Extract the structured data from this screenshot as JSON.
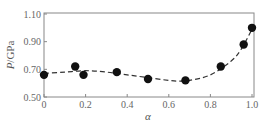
{
  "chart_data": {
    "type": "scatter",
    "title": "",
    "xlabel": "α",
    "ylabel": "P/GPa",
    "ylabel_italic_part": "P",
    "ylabel_rest": "/GPa",
    "xlim": [
      0,
      1.0
    ],
    "ylim": [
      0.5,
      1.1
    ],
    "xticks": [
      0,
      0.2,
      0.4,
      0.6,
      0.8,
      1.0
    ],
    "xtick_labels": [
      "0",
      "0.2",
      "0.4",
      "0.6",
      "0.8",
      "1.0"
    ],
    "yticks": [
      0.5,
      0.7,
      0.9,
      1.1
    ],
    "ytick_labels": [
      "0.50",
      "0.70",
      "0.90",
      "1.10"
    ],
    "grid": false,
    "legend": null,
    "series": [
      {
        "name": "measured",
        "style": "markers",
        "x": [
          0,
          0.15,
          0.19,
          0.35,
          0.5,
          0.68,
          0.85,
          0.96,
          1.0
        ],
        "y": [
          0.66,
          0.72,
          0.66,
          0.68,
          0.63,
          0.62,
          0.72,
          0.88,
          1.0
        ]
      },
      {
        "name": "fit",
        "style": "dashed-line",
        "x": [
          0,
          0.1,
          0.2,
          0.3,
          0.4,
          0.5,
          0.6,
          0.65,
          0.7,
          0.8,
          0.9,
          0.95,
          1.0
        ],
        "y": [
          0.67,
          0.68,
          0.69,
          0.68,
          0.66,
          0.64,
          0.62,
          0.615,
          0.62,
          0.66,
          0.76,
          0.85,
          0.99
        ]
      }
    ],
    "colors": {
      "marker": "#111111",
      "line": "#333333",
      "frame": "#888888"
    }
  }
}
